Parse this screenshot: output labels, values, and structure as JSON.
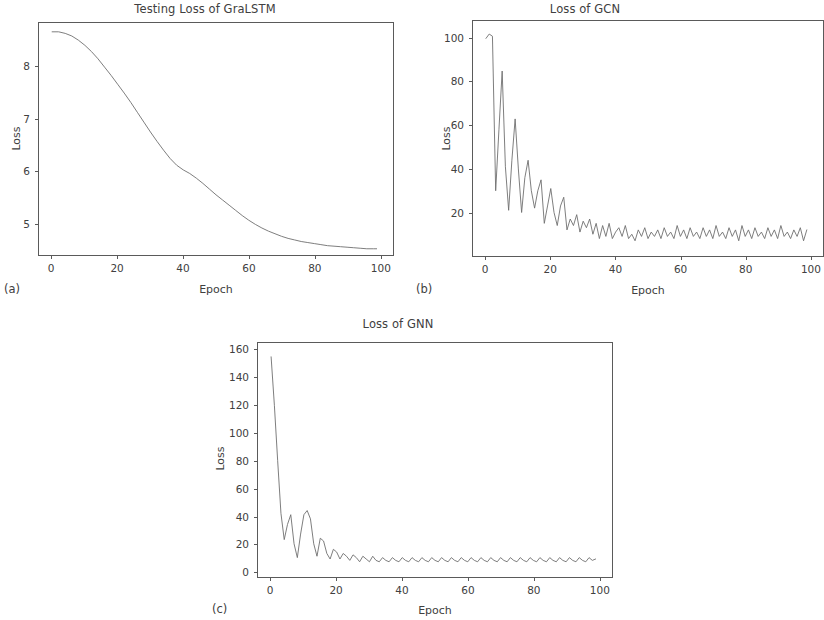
{
  "figure": {
    "background_color": "#ffffff",
    "line_color": "#6e6e6e",
    "axis_color": "#5a5a5a",
    "text_color": "#404040"
  },
  "panels": [
    {
      "letter": "(a)",
      "title": "Testing Loss of GraLSTM",
      "xlabel": "Epoch",
      "ylabel": "Loss",
      "yticks": [
        "5",
        "6",
        "7",
        "8"
      ],
      "xticks": [
        "0",
        "20",
        "40",
        "60",
        "80",
        "100"
      ]
    },
    {
      "letter": "(b)",
      "title": "Loss of GCN",
      "xlabel": "Epoch",
      "ylabel": "Loss",
      "yticks": [
        "20",
        "40",
        "60",
        "80",
        "100"
      ],
      "xticks": [
        "0",
        "20",
        "40",
        "60",
        "80",
        "100"
      ]
    },
    {
      "letter": "(c)",
      "title": "Loss of GNN",
      "xlabel": "Epoch",
      "ylabel": "Loss",
      "yticks": [
        "0",
        "20",
        "40",
        "60",
        "80",
        "100",
        "120",
        "140",
        "160"
      ],
      "xticks": [
        "0",
        "20",
        "40",
        "60",
        "80",
        "100"
      ]
    }
  ],
  "chart_data": [
    {
      "type": "line",
      "panel": "(a)",
      "title": "Testing Loss of GraLSTM",
      "xlabel": "Epoch",
      "ylabel": "Loss",
      "xlim": [
        -4,
        104
      ],
      "ylim": [
        4.38,
        8.85
      ],
      "yticks": [
        5,
        6,
        7,
        8
      ],
      "xticks": [
        0,
        20,
        40,
        60,
        80,
        100
      ],
      "grid": false,
      "legend": null,
      "series": [
        {
          "name": "Testing Loss",
          "x": [
            0,
            2,
            4,
            6,
            8,
            10,
            12,
            14,
            16,
            18,
            20,
            22,
            24,
            26,
            28,
            30,
            32,
            34,
            36,
            38,
            40,
            42,
            44,
            46,
            48,
            50,
            52,
            54,
            56,
            58,
            60,
            62,
            64,
            66,
            68,
            70,
            72,
            74,
            76,
            78,
            80,
            82,
            84,
            86,
            88,
            90,
            92,
            94,
            96,
            98,
            99
          ],
          "values": [
            8.68,
            8.68,
            8.65,
            8.6,
            8.52,
            8.42,
            8.3,
            8.16,
            8.0,
            7.84,
            7.67,
            7.5,
            7.32,
            7.13,
            6.94,
            6.75,
            6.57,
            6.4,
            6.24,
            6.11,
            6.02,
            5.95,
            5.86,
            5.76,
            5.65,
            5.54,
            5.44,
            5.34,
            5.24,
            5.14,
            5.05,
            4.97,
            4.9,
            4.84,
            4.79,
            4.74,
            4.7,
            4.67,
            4.64,
            4.62,
            4.6,
            4.58,
            4.56,
            4.55,
            4.54,
            4.53,
            4.52,
            4.51,
            4.5,
            4.5,
            4.5
          ]
        }
      ]
    },
    {
      "type": "line",
      "panel": "(b)",
      "title": "Loss of GCN",
      "xlabel": "Epoch",
      "ylabel": "Loss",
      "xlim": [
        -4,
        104
      ],
      "ylim": [
        0,
        108
      ],
      "yticks": [
        20,
        40,
        60,
        80,
        100
      ],
      "xticks": [
        0,
        20,
        40,
        60,
        80,
        100
      ],
      "grid": false,
      "legend": null,
      "series": [
        {
          "name": "Loss",
          "x": [
            0,
            1,
            2,
            3,
            4,
            5,
            6,
            7,
            8,
            9,
            10,
            11,
            12,
            13,
            14,
            15,
            16,
            17,
            18,
            19,
            20,
            21,
            22,
            23,
            24,
            25,
            26,
            27,
            28,
            29,
            30,
            31,
            32,
            33,
            34,
            35,
            36,
            37,
            38,
            39,
            40,
            41,
            42,
            43,
            44,
            45,
            46,
            47,
            48,
            49,
            50,
            51,
            52,
            53,
            54,
            55,
            56,
            57,
            58,
            59,
            60,
            61,
            62,
            63,
            64,
            65,
            66,
            67,
            68,
            69,
            70,
            71,
            72,
            73,
            74,
            75,
            76,
            77,
            78,
            79,
            80,
            81,
            82,
            83,
            84,
            85,
            86,
            87,
            88,
            89,
            90,
            91,
            92,
            93,
            94,
            95,
            96,
            97,
            98,
            99
          ],
          "values": [
            100,
            102,
            101,
            30,
            58,
            85,
            41,
            21,
            44,
            63,
            40,
            20,
            36,
            44,
            30,
            22,
            30,
            35,
            15,
            23,
            31,
            20,
            14,
            23,
            27,
            12,
            17,
            14,
            19,
            11,
            16,
            13,
            17,
            10,
            15,
            8,
            14,
            9,
            15,
            8,
            11,
            13,
            9,
            14,
            8,
            10,
            7,
            12,
            9,
            13,
            8,
            11,
            9,
            12,
            8,
            13,
            9,
            11,
            8,
            14,
            9,
            12,
            8,
            13,
            9,
            11,
            8,
            13,
            9,
            12,
            8,
            14,
            9,
            11,
            8,
            13,
            9,
            12,
            7,
            14,
            9,
            12,
            8,
            13,
            9,
            11,
            8,
            13,
            9,
            12,
            8,
            14,
            9,
            11,
            8,
            12,
            9,
            13,
            7,
            12
          ]
        }
      ]
    },
    {
      "type": "line",
      "panel": "(c)",
      "title": "Loss of GNN",
      "xlabel": "Epoch",
      "ylabel": "Loss",
      "xlim": [
        -4,
        104
      ],
      "ylim": [
        -4,
        165
      ],
      "yticks": [
        0,
        20,
        40,
        60,
        80,
        100,
        120,
        140,
        160
      ],
      "xticks": [
        0,
        20,
        40,
        60,
        80,
        100
      ],
      "grid": false,
      "legend": null,
      "series": [
        {
          "name": "Loss",
          "x": [
            0,
            1,
            2,
            3,
            4,
            5,
            6,
            7,
            8,
            9,
            10,
            11,
            12,
            13,
            14,
            15,
            16,
            17,
            18,
            19,
            20,
            21,
            22,
            23,
            24,
            25,
            26,
            27,
            28,
            29,
            30,
            31,
            32,
            33,
            34,
            35,
            36,
            37,
            38,
            39,
            40,
            41,
            42,
            43,
            44,
            45,
            46,
            47,
            48,
            49,
            50,
            51,
            52,
            53,
            54,
            55,
            56,
            57,
            58,
            59,
            60,
            61,
            62,
            63,
            64,
            65,
            66,
            67,
            68,
            69,
            70,
            71,
            72,
            73,
            74,
            75,
            76,
            77,
            78,
            79,
            80,
            81,
            82,
            83,
            84,
            85,
            86,
            87,
            88,
            89,
            90,
            91,
            92,
            93,
            94,
            95,
            96,
            97,
            98,
            99
          ],
          "values": [
            155,
            120,
            80,
            42,
            23,
            34,
            41,
            20,
            10,
            27,
            41,
            44,
            38,
            20,
            11,
            24,
            22,
            13,
            9,
            16,
            14,
            9,
            13,
            11,
            8,
            12,
            10,
            7,
            11,
            9,
            7,
            11,
            8,
            7,
            10,
            8,
            7,
            10,
            8,
            7,
            10,
            8,
            7,
            10,
            8,
            7,
            10,
            8,
            7,
            10,
            8,
            7,
            10,
            8,
            7,
            10,
            8,
            7,
            10,
            8,
            7,
            10,
            8,
            7,
            10,
            8,
            7,
            10,
            8,
            7,
            10,
            8,
            7,
            10,
            8,
            7,
            10,
            8,
            7,
            10,
            8,
            7,
            10,
            8,
            7,
            10,
            8,
            7,
            10,
            8,
            7,
            10,
            8,
            7,
            10,
            8,
            7,
            10,
            8,
            9
          ]
        }
      ]
    }
  ]
}
